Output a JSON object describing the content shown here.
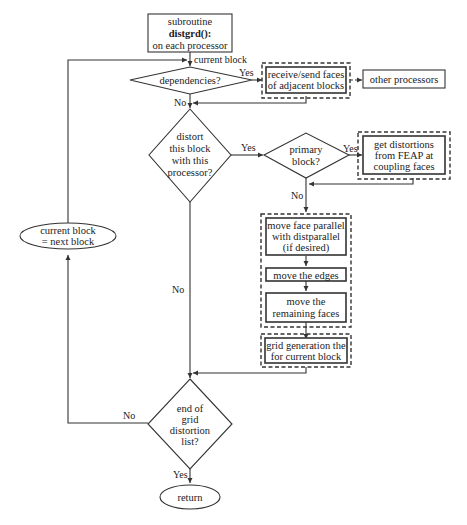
{
  "diagram": {
    "type": "flowchart",
    "nodes": {
      "start": {
        "lines": [
          "subroutine",
          "distgrd():",
          "on each processor"
        ],
        "shape": "rectangle"
      },
      "dependencies": {
        "lines": [
          "dependencies?"
        ],
        "shape": "diamond"
      },
      "receive_send": {
        "lines": [
          "receive/send faces",
          "of adjacent blocks"
        ],
        "shape": "rectangle-dashed-group"
      },
      "other_processors": {
        "lines": [
          "other processors"
        ],
        "shape": "rectangle"
      },
      "distort": {
        "lines": [
          "distort",
          "this block",
          "with this",
          "processor?"
        ],
        "shape": "diamond"
      },
      "primary": {
        "lines": [
          "primary",
          "block?"
        ],
        "shape": "diamond"
      },
      "get_distortions": {
        "lines": [
          "get distortions",
          "from FEAP at",
          "coupling faces"
        ],
        "shape": "rectangle-dashed-group"
      },
      "move_face": {
        "lines": [
          "move face parallel",
          "with distparallel",
          "(if desired)"
        ],
        "shape": "rectangle"
      },
      "move_edges": {
        "lines": [
          "move the edges"
        ],
        "shape": "rectangle"
      },
      "move_remaining": {
        "lines": [
          "move the",
          "remaining faces"
        ],
        "shape": "rectangle"
      },
      "grid_gen": {
        "lines": [
          "grid generation the",
          "for current block"
        ],
        "shape": "rectangle-dashed-group"
      },
      "end_list": {
        "lines": [
          "end of",
          "grid",
          "distortion",
          "list?"
        ],
        "shape": "diamond"
      },
      "next_block": {
        "lines": [
          "current block",
          "= next block"
        ],
        "shape": "ellipse"
      },
      "return": {
        "lines": [
          "return"
        ],
        "shape": "ellipse"
      }
    },
    "edge_labels": {
      "current_block": "current block",
      "dep_yes": "Yes",
      "dep_no": "No",
      "distort_yes": "Yes",
      "distort_no": "No",
      "primary_yes": "Yes",
      "primary_no": "No",
      "end_no": "No",
      "end_yes": "Yes"
    }
  }
}
